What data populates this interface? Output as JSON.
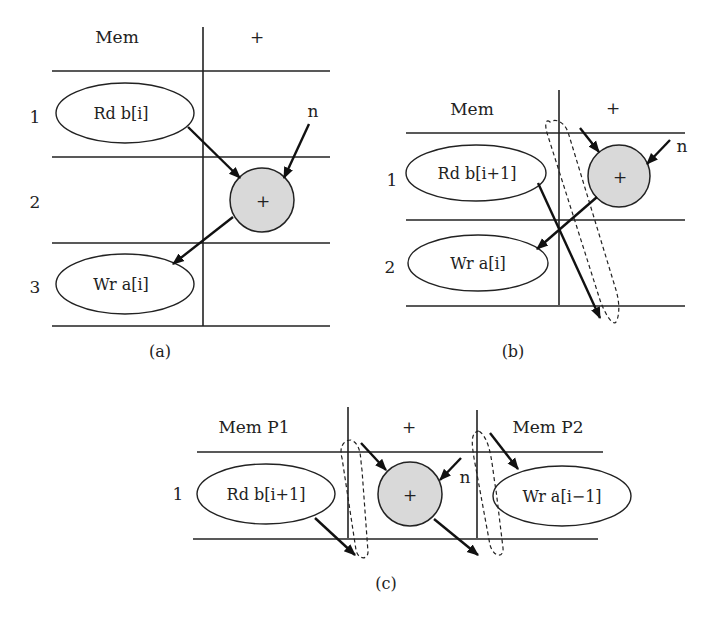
{
  "figure": {
    "panels": [
      {
        "id": "a",
        "caption": "(a)",
        "columns": [
          "Mem",
          "+"
        ],
        "rows": [
          "1",
          "2",
          "3"
        ],
        "nodes": {
          "read": "Rd b[i]",
          "op": "+",
          "write": "Wr a[i]",
          "input": "n"
        }
      },
      {
        "id": "b",
        "caption": "(b)",
        "columns": [
          "Mem",
          "+"
        ],
        "rows": [
          "1",
          "2"
        ],
        "nodes": {
          "read": "Rd b[i+1]",
          "op": "+",
          "write": "Wr a[i]",
          "input": "n"
        }
      },
      {
        "id": "c",
        "caption": "(c)",
        "columns": [
          "Mem P1",
          "+",
          "Mem P2"
        ],
        "rows": [
          "1"
        ],
        "nodes": {
          "read": "Rd b[i+1]",
          "op": "+",
          "write": "Wr a[i−1]",
          "input": "n"
        }
      }
    ],
    "colors": {
      "stroke": "#222222",
      "node_fill": "#d9d9d9",
      "background": "#ffffff"
    }
  }
}
